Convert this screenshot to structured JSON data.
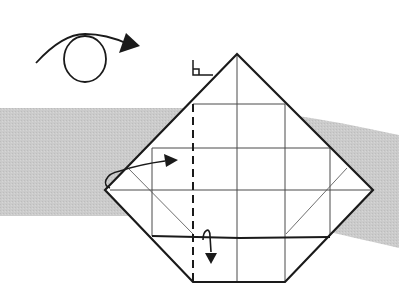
{
  "diagram": {
    "type": "origami-instruction-step",
    "colors": {
      "background": "#ffffff",
      "band": "#c9c9c9",
      "line": "#1a1a1a",
      "crease": "#4a4a4a"
    },
    "symbols": {
      "turn_over": "turn-over-symbol (loop arrow)",
      "fold_behind_left": "fold-behind arrow pointing right",
      "fold_behind_bottom": "fold-behind arrow pointing down",
      "right_angle": "right-angle marker",
      "valley_fold": "dashed vertical fold line"
    }
  }
}
